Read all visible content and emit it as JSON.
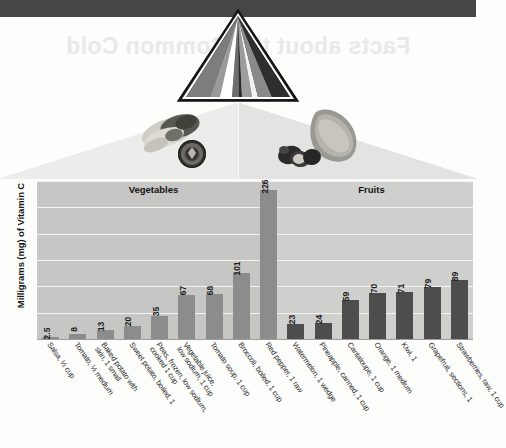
{
  "page": {
    "ghost_title": "Facts about the Common Cold"
  },
  "graphic": {
    "pyramid_name": "food-pyramid",
    "veg_photo_name": "vegetables-photo",
    "fruit_photo_name": "fruits-photo"
  },
  "chart_data": {
    "type": "bar",
    "title": "",
    "xlabel": "",
    "ylabel": "Milligrams (mg) of Vitamin C",
    "ylim": [
      0,
      240
    ],
    "grid": true,
    "gridlines": [
      40,
      80,
      120,
      160,
      200,
      240
    ],
    "legend_position": "none",
    "group_labels": [
      "Vegetables",
      "Fruits"
    ],
    "groups": [
      {
        "name": "Vegetables",
        "count": 9,
        "color": "#8c8c8c"
      },
      {
        "name": "Fruits",
        "count": 6,
        "color": "#4d4d4d"
      }
    ],
    "categories": [
      "Salsa, ½ cup",
      "Tomato, ½ medium",
      "Baked potato with skin, 1 small",
      "Sweet potato, boiled, 1",
      "Peas, frozen, low sodium, cooked 1 cup",
      "Vegetable juice, low sodium, 1 cup",
      "Tomato soup, 1 cup",
      "Broccoli, boiled, 1 cup",
      "Red pepper, 1 raw",
      "Watermelon, 1 wedge",
      "Pineapple, canned, 1 cup",
      "Cantaloupe, 1 cup",
      "Orange, 1 medium",
      "Kiwi, 1",
      "Grapefruit, sections, 1",
      "Strawberries, raw, 1 cup"
    ],
    "values": [
      2.5,
      8,
      13,
      20,
      35,
      67,
      68,
      101,
      226,
      23,
      24,
      59,
      70,
      71,
      79,
      89
    ],
    "value_labels": [
      "2.5",
      "8",
      "13",
      "20",
      "35",
      "67",
      "68",
      "101",
      "226",
      "23",
      "24",
      "59",
      "70",
      "71",
      "79",
      "89"
    ],
    "category_lines": [
      [
        "Salsa, ½ cup"
      ],
      [
        "Tomato, ½ medium"
      ],
      [
        "Baked potato with",
        "skin, 1 small"
      ],
      [
        "Sweet potato, boiled, 1"
      ],
      [
        "Peas, frozen, low sodium,",
        "cooked 1 cup"
      ],
      [
        "Vegetable juice,",
        "low sodium, 1 cup"
      ],
      [
        "Tomato soup, 1 cup"
      ],
      [
        "Broccoli, boiled, 1 cup"
      ],
      [
        "Red pepper, 1 raw"
      ],
      [
        "Watermelon, 1 wedge"
      ],
      [
        "Pineapple, canned, 1 cup"
      ],
      [
        "Cantaloupe, 1 cup"
      ],
      [
        "Orange, 1 medium"
      ],
      [
        "Kiwi, 1"
      ],
      [
        "Grapefruit, sections, 1"
      ],
      [
        "Strawberries, raw, 1 cup"
      ]
    ]
  },
  "colors": {
    "band": "#464646",
    "veg_bar": "#8c8c8c",
    "fruit_bar": "#4d4d4d",
    "plot_bg": "#c9c9c7",
    "gridline": "#f3f3f1"
  }
}
